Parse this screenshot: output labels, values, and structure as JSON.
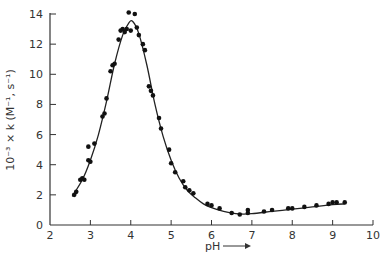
{
  "chart_data": {
    "type": "scatter",
    "title": "",
    "xlabel": "pH",
    "xlabel_arrow": "→",
    "ylabel": "10⁻³ × k (M⁻¹, s⁻¹)",
    "xlim": [
      2,
      10
    ],
    "ylim": [
      0,
      14
    ],
    "xticks": [
      2,
      3,
      4,
      5,
      6,
      7,
      8,
      9,
      10
    ],
    "xtick_labels": [
      "2",
      "3",
      "4",
      "5",
      "6",
      "7",
      "8",
      "9",
      "10"
    ],
    "yticks": [
      0,
      2,
      4,
      6,
      8,
      10,
      12,
      14
    ],
    "ytick_labels": [
      "0",
      "2",
      "4",
      "6",
      "8",
      "10",
      "12",
      "14"
    ],
    "grid": false,
    "legend": null,
    "series": [
      {
        "name": "observed",
        "kind": "scatter",
        "x": [
          2.6,
          2.65,
          2.75,
          2.8,
          2.85,
          2.95,
          2.95,
          3.0,
          3.1,
          3.3,
          3.35,
          3.4,
          3.5,
          3.55,
          3.6,
          3.7,
          3.75,
          3.8,
          3.85,
          3.9,
          4.0,
          3.95,
          4.1,
          4.15,
          4.2,
          4.3,
          4.35,
          4.45,
          4.5,
          4.55,
          4.7,
          4.75,
          4.95,
          5.0,
          5.1,
          5.3,
          5.35,
          5.45,
          5.55,
          5.9,
          6.0,
          6.2,
          6.5,
          6.7,
          6.9,
          6.9,
          7.3,
          7.5,
          7.9,
          8.0,
          8.3,
          8.6,
          8.9,
          9.0,
          9.1,
          9.3
        ],
        "y": [
          2.0,
          2.2,
          3.0,
          3.1,
          3.0,
          4.3,
          5.2,
          4.2,
          5.4,
          7.2,
          7.4,
          8.4,
          10.2,
          10.6,
          10.7,
          12.3,
          12.9,
          13.0,
          12.8,
          13.0,
          12.9,
          14.1,
          14.0,
          13.1,
          12.6,
          12.0,
          11.6,
          9.2,
          8.9,
          8.6,
          7.1,
          6.4,
          5.0,
          4.1,
          3.5,
          2.9,
          2.5,
          2.3,
          2.1,
          1.4,
          1.3,
          1.1,
          0.8,
          0.7,
          0.8,
          1.0,
          0.9,
          1.0,
          1.1,
          1.1,
          1.2,
          1.3,
          1.4,
          1.5,
          1.5,
          1.5
        ]
      },
      {
        "name": "fitted curve",
        "kind": "line",
        "x": [
          2.55,
          2.8,
          3.0,
          3.2,
          3.4,
          3.6,
          3.8,
          3.95,
          4.05,
          4.2,
          4.4,
          4.6,
          4.8,
          5.0,
          5.2,
          5.4,
          5.6,
          5.8,
          6.0,
          6.3,
          6.6,
          6.8,
          7.0,
          7.5,
          8.0,
          8.5,
          9.0,
          9.3
        ],
        "y": [
          1.9,
          3.0,
          4.3,
          6.0,
          8.2,
          10.7,
          12.6,
          13.4,
          13.5,
          12.7,
          10.6,
          8.0,
          5.9,
          4.3,
          3.1,
          2.3,
          1.8,
          1.4,
          1.15,
          0.9,
          0.75,
          0.72,
          0.75,
          0.9,
          1.05,
          1.2,
          1.35,
          1.4
        ]
      }
    ]
  }
}
